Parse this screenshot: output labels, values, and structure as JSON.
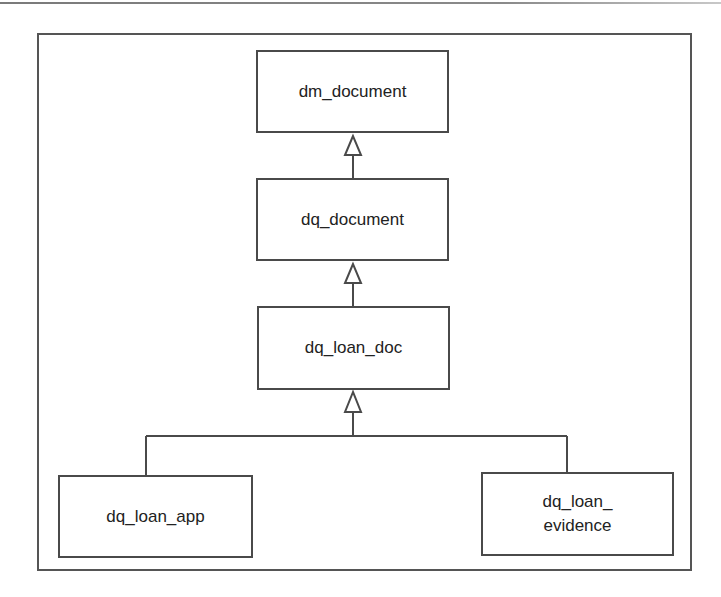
{
  "diagram": {
    "type": "class-inheritance",
    "nodes": [
      {
        "id": "dm_document",
        "label": "dm_document"
      },
      {
        "id": "dq_document",
        "label": "dq_document"
      },
      {
        "id": "dq_loan_doc",
        "label": "dq_loan_doc"
      },
      {
        "id": "dq_loan_app",
        "label": "dq_loan_app"
      },
      {
        "id": "dq_loan_evidence",
        "label": "dq_loan_\nevidence"
      }
    ],
    "edges": [
      {
        "from": "dq_document",
        "to": "dm_document",
        "kind": "generalization"
      },
      {
        "from": "dq_loan_doc",
        "to": "dq_document",
        "kind": "generalization"
      },
      {
        "from": "dq_loan_app",
        "to": "dq_loan_doc",
        "kind": "generalization"
      },
      {
        "from": "dq_loan_evidence",
        "to": "dq_loan_doc",
        "kind": "generalization"
      }
    ],
    "colors": {
      "line": "#4a4a4a",
      "frame": "#555555",
      "text": "#222222",
      "background": "#ffffff"
    }
  }
}
